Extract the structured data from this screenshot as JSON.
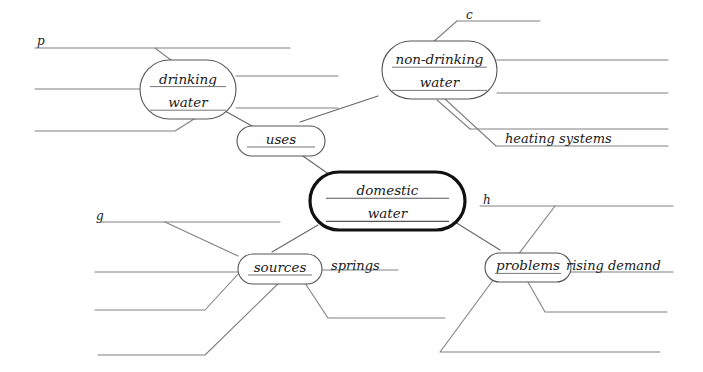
{
  "diagram": {
    "canvas": {
      "width": 703,
      "height": 372
    },
    "colors": {
      "background": "#ffffff",
      "line": "#808080",
      "node_border": "#555555",
      "central_border": "#111111",
      "text": "#1a1a1a"
    },
    "central_node": {
      "name": "domestic-water",
      "line1": "domestic",
      "line2": "water",
      "x": 310,
      "y": 172,
      "w": 155,
      "h": 58
    },
    "nodes": [
      {
        "name": "drinking-water",
        "line1": "drinking",
        "line2": "water",
        "x": 140,
        "y": 60,
        "w": 96,
        "h": 59
      },
      {
        "name": "non-drinking-water",
        "line1": "non-drinking",
        "line2": "water",
        "x": 382,
        "y": 41,
        "w": 115,
        "h": 58
      },
      {
        "name": "uses",
        "line1": "uses",
        "line2": "",
        "x": 237,
        "y": 126,
        "w": 88,
        "h": 30
      },
      {
        "name": "sources",
        "line1": "sources",
        "line2": "",
        "x": 238,
        "y": 254,
        "w": 84,
        "h": 30
      },
      {
        "name": "problems",
        "line1": "problems",
        "line2": "",
        "x": 485,
        "y": 253,
        "w": 86,
        "h": 29
      }
    ],
    "labels": [
      {
        "name": "label-p",
        "text": "p",
        "x": 37,
        "y": 45
      },
      {
        "name": "label-c",
        "text": "c",
        "x": 466,
        "y": 19
      },
      {
        "name": "label-g",
        "text": "g",
        "x": 96,
        "y": 220
      },
      {
        "name": "label-h",
        "text": "h",
        "x": 483,
        "y": 204
      },
      {
        "name": "label-heating-systems",
        "text": "heating systems",
        "x": 505,
        "y": 143
      },
      {
        "name": "label-springs",
        "text": "springs",
        "x": 331,
        "y": 270
      },
      {
        "name": "label-rising-demand",
        "text": "rising demand",
        "x": 566,
        "y": 270
      }
    ],
    "branches": [
      {
        "name": "branch-p-line",
        "d": "M 35 48 L 290 48"
      },
      {
        "name": "branch-p-diag",
        "d": "M 155 48 L 200 82"
      },
      {
        "name": "branch-drinking-left-mid",
        "d": "M 35 89 L 142 89"
      },
      {
        "name": "branch-drinking-left-low",
        "d": "M 35 131 L 175 131 L 202 114"
      },
      {
        "name": "branch-drinking-right-top",
        "d": "M 236 76 L 338 76"
      },
      {
        "name": "branch-drinking-right-mid",
        "d": "M 236 108 L 338 108"
      },
      {
        "name": "branch-c-line",
        "d": "M 457 21 L 540 21"
      },
      {
        "name": "branch-c-diag",
        "d": "M 457 21 L 432 43"
      },
      {
        "name": "branch-nondrinking-right-top",
        "d": "M 497 60 L 668 60"
      },
      {
        "name": "branch-nondrinking-right-mid",
        "d": "M 497 93 L 668 93"
      },
      {
        "name": "branch-nondrinking-right-low",
        "d": "M 470 129 L 668 129"
      },
      {
        "name": "branch-nondrinking-heating-diag",
        "d": "M 445 99 L 496 146"
      },
      {
        "name": "branch-heating-line",
        "d": "M 496 146 L 668 146"
      },
      {
        "name": "branch-nondrinking-low-diag",
        "d": "M 437 100 L 470 129"
      },
      {
        "name": "branch-g-line",
        "d": "M 100 222 L 280 222"
      },
      {
        "name": "branch-g-diag",
        "d": "M 165 222 L 238 256"
      },
      {
        "name": "branch-sources-left-mid",
        "d": "M 95 272 L 238 272"
      },
      {
        "name": "branch-sources-left-low",
        "d": "M 95 310 L 205 310 L 240 272"
      },
      {
        "name": "branch-sources-left-bottom",
        "d": "M 98 355 L 205 355 L 290 272"
      },
      {
        "name": "branch-springs-line",
        "d": "M 322 270 L 398 270"
      },
      {
        "name": "branch-sources-down-right",
        "d": "M 295 268 L 328 318 L 445 318"
      },
      {
        "name": "branch-h-line",
        "d": "M 480 206 L 673 206"
      },
      {
        "name": "branch-h-diag",
        "d": "M 555 206 L 508 268"
      },
      {
        "name": "branch-problems-down-mid",
        "d": "M 520 268 L 545 312 L 667 312"
      },
      {
        "name": "branch-problems-down-low",
        "d": "M 502 268 L 440 352 L 660 352"
      },
      {
        "name": "branch-rising-demand-line",
        "d": "M 566 272 L 673 272"
      }
    ],
    "connectors": [
      {
        "name": "connector-drinking-to-uses",
        "d": "M 225 111 L 252 126"
      },
      {
        "name": "connector-nondrinking-to-uses",
        "d": "M 378 96 L 300 122"
      },
      {
        "name": "connector-uses-to-domestic",
        "d": "M 290 147 L 330 175"
      },
      {
        "name": "connector-domestic-to-sources",
        "d": "M 318 225 L 272 252"
      },
      {
        "name": "connector-domestic-to-problems",
        "d": "M 455 222 L 500 250"
      }
    ]
  }
}
